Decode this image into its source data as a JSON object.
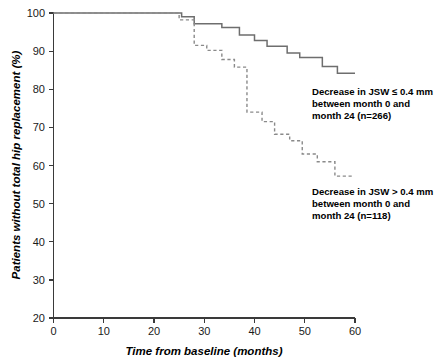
{
  "chart_data": {
    "type": "line",
    "subtype": "kaplan-meier-step",
    "title": "",
    "xlabel": "Time from baseline (months)",
    "ylabel": "Patients without total hip replacement (%)",
    "xlim": [
      0,
      60
    ],
    "ylim": [
      20,
      100
    ],
    "xticks": [
      0,
      10,
      20,
      30,
      40,
      50,
      60
    ],
    "yticks": [
      20,
      30,
      40,
      50,
      60,
      70,
      80,
      90,
      100
    ],
    "grid": false,
    "legend_position": "inline-annotations",
    "series": [
      {
        "name": "Decrease in JSW ≤ 0.4 mm between month 0 and month 24 (n=266)",
        "style": "solid",
        "color": "#6e6e6e",
        "n": 266,
        "points": [
          {
            "x": 0,
            "y": 100
          },
          {
            "x": 25.5,
            "y": 100
          },
          {
            "x": 25.5,
            "y": 99.0
          },
          {
            "x": 28.0,
            "y": 99.0
          },
          {
            "x": 28.0,
            "y": 97.2
          },
          {
            "x": 33.5,
            "y": 97.2
          },
          {
            "x": 33.5,
            "y": 96.2
          },
          {
            "x": 37.0,
            "y": 96.2
          },
          {
            "x": 37.0,
            "y": 94.2
          },
          {
            "x": 40.0,
            "y": 94.2
          },
          {
            "x": 40.0,
            "y": 92.8
          },
          {
            "x": 42.5,
            "y": 92.8
          },
          {
            "x": 42.5,
            "y": 91.3
          },
          {
            "x": 46.5,
            "y": 91.3
          },
          {
            "x": 46.5,
            "y": 89.5
          },
          {
            "x": 49.0,
            "y": 89.5
          },
          {
            "x": 49.0,
            "y": 88.3
          },
          {
            "x": 53.5,
            "y": 88.3
          },
          {
            "x": 53.5,
            "y": 86.0
          },
          {
            "x": 56.5,
            "y": 86.0
          },
          {
            "x": 56.5,
            "y": 84.2
          },
          {
            "x": 60.0,
            "y": 84.2
          }
        ]
      },
      {
        "name": "Decrease in JSW > 0.4 mm between month 0 and month 24 (n=118)",
        "style": "dashed",
        "color": "#8a8a8a",
        "n": 118,
        "points": [
          {
            "x": 0,
            "y": 100
          },
          {
            "x": 25.0,
            "y": 100
          },
          {
            "x": 25.0,
            "y": 98.2
          },
          {
            "x": 28.0,
            "y": 98.2
          },
          {
            "x": 28.0,
            "y": 91.5
          },
          {
            "x": 30.5,
            "y": 91.5
          },
          {
            "x": 30.5,
            "y": 90.2
          },
          {
            "x": 33.5,
            "y": 90.2
          },
          {
            "x": 33.5,
            "y": 87.8
          },
          {
            "x": 36.0,
            "y": 87.8
          },
          {
            "x": 36.0,
            "y": 85.8
          },
          {
            "x": 38.5,
            "y": 85.8
          },
          {
            "x": 38.5,
            "y": 74.0
          },
          {
            "x": 41.5,
            "y": 74.0
          },
          {
            "x": 41.5,
            "y": 71.5
          },
          {
            "x": 44.0,
            "y": 71.5
          },
          {
            "x": 44.0,
            "y": 68.2
          },
          {
            "x": 47.0,
            "y": 68.2
          },
          {
            "x": 47.0,
            "y": 66.5
          },
          {
            "x": 49.5,
            "y": 66.5
          },
          {
            "x": 49.5,
            "y": 63.0
          },
          {
            "x": 52.5,
            "y": 63.0
          },
          {
            "x": 52.5,
            "y": 61.0
          },
          {
            "x": 56.0,
            "y": 61.0
          },
          {
            "x": 56.0,
            "y": 57.2
          },
          {
            "x": 59.5,
            "y": 57.2
          }
        ]
      }
    ],
    "annotations": [
      {
        "id": "annotation-solid",
        "lines": [
          "Decrease in JSW ≤ 0.4 mm",
          "between month 0 and",
          "month 24 (n=266)"
        ]
      },
      {
        "id": "annotation-dashed",
        "lines": [
          "Decrease in JSW > 0.4 mm",
          "between month 0 and",
          "month 24 (n=118)"
        ]
      }
    ]
  }
}
